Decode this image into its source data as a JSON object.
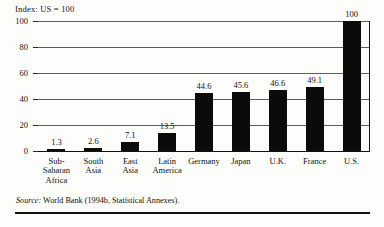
{
  "chart_data": {
    "type": "bar",
    "title": "Index: US = 100",
    "xlabel": "",
    "ylabel": "",
    "ylim": [
      0,
      100
    ],
    "yticks": [
      0,
      20,
      40,
      60,
      80,
      100
    ],
    "ytick_labels": [
      "0",
      "20",
      "40",
      "60",
      "80",
      "100"
    ],
    "grid": true,
    "legend": "none",
    "categories": [
      "Sub-Saharan Africa",
      "South Asia",
      "East Asia",
      "Latin America",
      "Germany",
      "Japan",
      "U.K.",
      "France",
      "U.S."
    ],
    "category_label_lines": [
      [
        "Sub-",
        "Saharan",
        "Africa"
      ],
      [
        "South",
        "Asia"
      ],
      [
        "East",
        "Asia"
      ],
      [
        "Latin",
        "America"
      ],
      [
        "Germany"
      ],
      [
        "Japan"
      ],
      [
        "U.K."
      ],
      [
        "France"
      ],
      [
        "U.S."
      ]
    ],
    "values": [
      1.3,
      2.6,
      7.1,
      13.5,
      44.6,
      45.6,
      46.6,
      49.1,
      100
    ],
    "value_labels": [
      "1.3",
      "2.6",
      "7.1",
      "13.5",
      "44.6",
      "45.6",
      "46.6",
      "49.1",
      "100"
    ],
    "bar_color": "#0b0b0b"
  },
  "source": {
    "label": "Source:",
    "text": "World Bank (1994b, Statistical Annexes)."
  }
}
